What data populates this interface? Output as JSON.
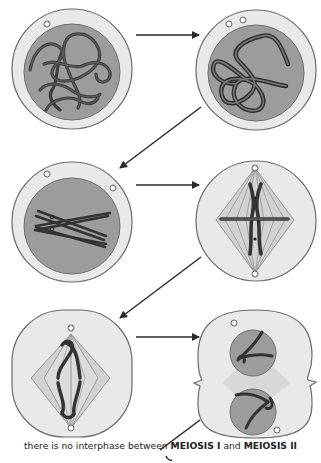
{
  "diagram": {
    "colors": {
      "cell_fill": "#e9e9e9",
      "cell_outline": "#6a6a6a",
      "nucleus_fill": "#9c9c9c",
      "nucleus_outline": "#6e6e6e",
      "chromosome": "#4a4a4a",
      "chromosome_outline": "#2e2e2e",
      "spindle_fill": "#d2d2d2",
      "spindle_line": "#8c8c8c",
      "arrow": "#2a2a2a"
    },
    "cells": [
      {
        "id": "cell-1",
        "stage": "early-prophase-I",
        "row": 1,
        "col": 1
      },
      {
        "id": "cell-2",
        "stage": "mid-prophase-I",
        "row": 1,
        "col": 2
      },
      {
        "id": "cell-3",
        "stage": "late-prophase-I",
        "row": 2,
        "col": 1
      },
      {
        "id": "cell-4",
        "stage": "metaphase-I",
        "row": 2,
        "col": 2
      },
      {
        "id": "cell-5",
        "stage": "anaphase-I",
        "row": 3,
        "col": 1
      },
      {
        "id": "cell-6",
        "stage": "telophase-I",
        "row": 3,
        "col": 2
      }
    ],
    "arrows": [
      {
        "from": "cell-1",
        "to": "cell-2",
        "direction": "right"
      },
      {
        "from": "cell-2",
        "to": "cell-3",
        "direction": "down-left"
      },
      {
        "from": "cell-3",
        "to": "cell-4",
        "direction": "right"
      },
      {
        "from": "cell-4",
        "to": "cell-5",
        "direction": "down-left"
      },
      {
        "from": "cell-5",
        "to": "cell-6",
        "direction": "right"
      },
      {
        "from": "cell-6",
        "to": "next",
        "direction": "down-left"
      }
    ],
    "caption": {
      "prefix": "there is no interphase between ",
      "term1": "MEIOSIS I",
      "middle": " and ",
      "term2": "MEIOSIS II"
    }
  }
}
